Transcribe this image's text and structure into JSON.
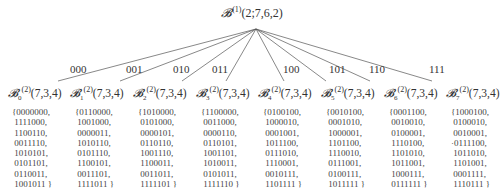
{
  "root": {
    "symbol": "𝓑",
    "superscript": "(1)",
    "params": "(2;7,6,2)"
  },
  "edges": [
    {
      "label": "000",
      "x": 78,
      "y": 70
    },
    {
      "label": "001",
      "x": 134,
      "y": 70
    },
    {
      "label": "010",
      "x": 178,
      "y": 70
    },
    {
      "label": "011",
      "x": 214,
      "y": 70
    },
    {
      "label": "100",
      "x": 286,
      "y": 70
    },
    {
      "label": "101",
      "x": 332,
      "y": 70
    },
    {
      "label": "110",
      "x": 370,
      "y": 70
    },
    {
      "label": "111",
      "x": 430,
      "y": 70
    }
  ],
  "children": [
    {
      "symbol": "𝓑",
      "sub": "0",
      "sup": "(2)",
      "params": "(7,3,4)",
      "codewords": [
        "{0000000,",
        " 1111000,",
        " 1100110,",
        " 0011110,",
        " 1010101,",
        " 0101101,",
        " 0110011,",
        " 1001011 }"
      ]
    },
    {
      "symbol": "𝓑",
      "sub": "1",
      "sup": "(2)",
      "params": "(7,3,4)",
      "codewords": [
        "{0110000,",
        " 1001000,",
        " 0000011,",
        " 1010110,",
        " 0101110,",
        " 1100101,",
        " 0011101,",
        " 1111011 }"
      ]
    },
    {
      "symbol": "𝓑",
      "sub": "2",
      "sup": "(2)",
      "params": "(7,3,4)",
      "codewords": [
        "{1010000,",
        " 0101000,",
        " 0000101,",
        " 0110110,",
        " 1001110,",
        " 1100011,",
        " 0011011,",
        " 1111101 }"
      ]
    },
    {
      "symbol": "𝓑",
      "sub": "3",
      "sup": "(2)",
      "params": "(7,3,4)",
      "codewords": [
        "{1100000,",
        " 0011000,",
        " 0000110,",
        " 0110101,",
        " 1001101,",
        " 1010011,",
        " 0101011,",
        " 1111110 }"
      ]
    },
    {
      "symbol": "𝓑",
      "sub": "4",
      "sup": "(2)",
      "params": "(7,3,4)",
      "codewords": [
        "{0100100,",
        " 1000010,",
        " 0001001,",
        " 1011100,",
        " 0111010,",
        " 1110001,",
        " 0010111,",
        " 1101111 }"
      ]
    },
    {
      "symbol": "𝓑",
      "sub": "5",
      "sup": "(2)",
      "params": "(7,3,4)",
      "codewords": [
        "{0010100,",
        " 0001010,",
        " 1000001,",
        " 1101100,",
        " 1110010,",
        " 0111001,",
        " 0100111,",
        " 1011111 }"
      ]
    },
    {
      "symbol": "𝓑",
      "sub": "6",
      "sup": "(2)",
      "params": "(7,3,4)",
      "codewords": [
        "{0001100,",
        " 0010010,",
        " 0100001,",
        " 1110100,",
        " 1101010,",
        " 1011001,",
        " 1000111,",
        " 0111111 }"
      ]
    },
    {
      "symbol": "𝓑",
      "sub": "7",
      "sup": "(2)",
      "params": "(7,3,4)",
      "codewords": [
        "{1000100,",
        " 0100010,",
        " 0010001,",
        "·0111100,",
        " 1011010,",
        " 1101001,",
        " 0001111,",
        " 1110111 }"
      ]
    }
  ]
}
